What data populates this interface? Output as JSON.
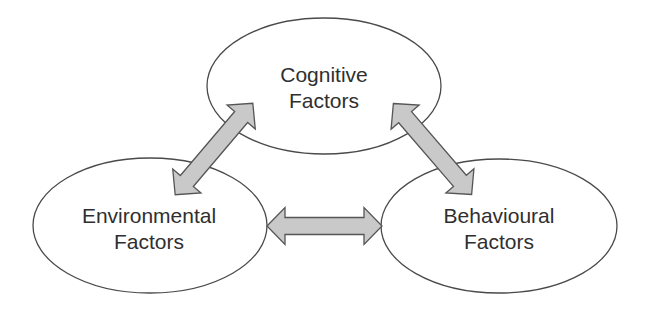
{
  "diagram": {
    "type": "triadic-relationship",
    "nodes": [
      {
        "id": "cognitive",
        "line1": "Cognitive",
        "line2": "Factors"
      },
      {
        "id": "environmental",
        "line1": "Environmental",
        "line2": "Factors"
      },
      {
        "id": "behavioural",
        "line1": "Behavioural",
        "line2": "Factors"
      }
    ],
    "edges": [
      {
        "from": "cognitive",
        "to": "environmental",
        "direction": "bidirectional"
      },
      {
        "from": "cognitive",
        "to": "behavioural",
        "direction": "bidirectional"
      },
      {
        "from": "environmental",
        "to": "behavioural",
        "direction": "bidirectional"
      }
    ],
    "colors": {
      "arrow_fill": "#c9c9c9",
      "arrow_stroke": "#555555",
      "ellipse_stroke": "#4a4a4a",
      "text": "#2f2f2f"
    }
  }
}
